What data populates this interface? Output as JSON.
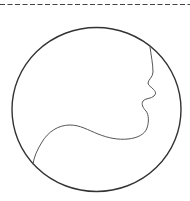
{
  "figure": {
    "background": "#ffffff",
    "divider": {
      "style": "dashed",
      "color": "#444444",
      "y": 4.5,
      "dash": [
        5,
        2.5
      ]
    },
    "circle": {
      "cx": 96.5,
      "cy": 109.5,
      "rx": 84.5,
      "ry": 82,
      "stroke": "#333333",
      "stroke_width": 1.4
    },
    "profile": {
      "stroke": "#555555",
      "stroke_width": 1
    }
  }
}
